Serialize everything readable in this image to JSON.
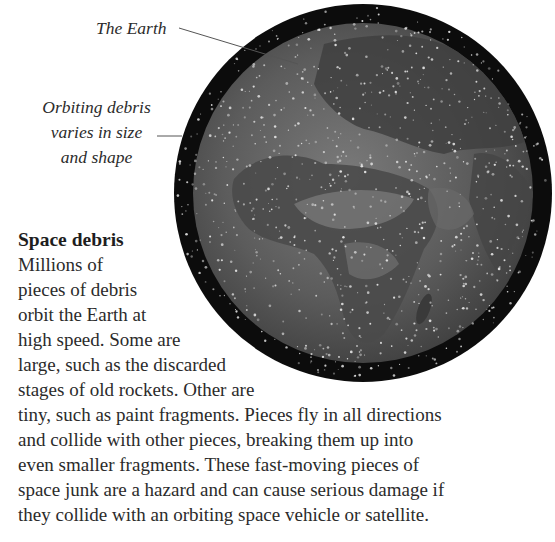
{
  "figure": {
    "image_alt": "Earth globe surrounded by orbiting space debris",
    "labels": {
      "earth": "The Earth",
      "debris_lines": [
        "Orbiting debris",
        "varies in size",
        "and shape"
      ]
    }
  },
  "article": {
    "heading": "Space debris",
    "lines": [
      "Millions of",
      "pieces of debris",
      "orbit the Earth at",
      "high speed. Some are",
      "large, such as the discarded",
      "stages of old rockets. Other are",
      "tiny, such as paint fragments. Pieces fly in all directions",
      "and collide with other pieces, breaking them up into",
      "even smaller fragments. These fast-moving pieces of",
      "space junk are a hazard and can cause serious damage if",
      "they collide with an orbiting space vehicle or satellite."
    ]
  },
  "colors": {
    "text": "#2b2b2b",
    "globe_rim": "#0d0d0d",
    "globe_surface": "#5a5a5a",
    "debris_dots": "#e8e8e8"
  }
}
